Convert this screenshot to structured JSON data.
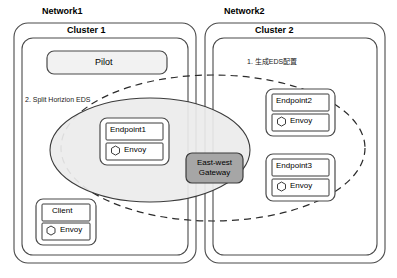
{
  "diagram": {
    "type": "architecture-diagram",
    "background": "#ffffff",
    "stroke_color": "#3b3b3b",
    "fill_light": "#f2f2f2",
    "fill_gateway": "#a6a6a6",
    "fill_ellipse": "#ececec"
  },
  "networks": [
    {
      "id": "network1",
      "label": "Network1",
      "cluster": {
        "id": "cluster1",
        "label": "Cluster 1",
        "note": "2. Split Horizion EDS",
        "nodes": [
          {
            "id": "pilot",
            "label": "Pilot",
            "kind": "control-plane"
          },
          {
            "id": "endpoint1",
            "label": "Endpoint1",
            "sidecar": "Envoy",
            "icon": "hexagon-icon"
          },
          {
            "id": "client",
            "label": "Client",
            "sidecar": "Envoy",
            "icon": "hexagon-icon"
          }
        ]
      }
    },
    {
      "id": "network2",
      "label": "Network2",
      "cluster": {
        "id": "cluster2",
        "label": "Cluster 2",
        "note": "1. 生成EDS配置",
        "nodes": [
          {
            "id": "endpoint2",
            "label": "Endpoint2",
            "sidecar": "Envoy",
            "icon": "hexagon-icon"
          },
          {
            "id": "endpoint3",
            "label": "Endpoint3",
            "sidecar": "Envoy",
            "icon": "hexagon-icon"
          }
        ]
      }
    }
  ],
  "gateway": {
    "id": "east-west-gateway",
    "line1": "East-west",
    "line2": "Gateway",
    "fill": "#a6a6a6"
  },
  "groupings": [
    {
      "id": "local-scope-ellipse",
      "style": "solid",
      "fill": "#ececec",
      "contains": [
        "endpoint1",
        "east-west-gateway"
      ]
    },
    {
      "id": "cross-network-scope-ellipse",
      "style": "dashed",
      "fill": "none",
      "contains": [
        "endpoint1",
        "east-west-gateway",
        "endpoint2",
        "endpoint3"
      ]
    }
  ]
}
